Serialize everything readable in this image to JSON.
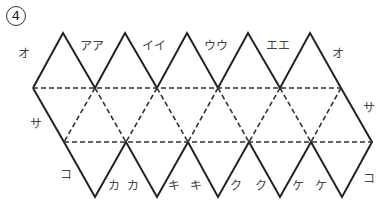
{
  "problem_number": "4",
  "labels": {
    "top": [
      {
        "text": "オ",
        "x": 18,
        "y": 48
      },
      {
        "text": "アア",
        "x": 80,
        "y": 40
      },
      {
        "text": "イイ",
        "x": 142,
        "y": 40
      },
      {
        "text": "ウウ",
        "x": 204,
        "y": 40
      },
      {
        "text": "エエ",
        "x": 266,
        "y": 40
      },
      {
        "text": "オ",
        "x": 332,
        "y": 48
      }
    ],
    "side": [
      {
        "text": "サ",
        "x": 30,
        "y": 118
      },
      {
        "text": "サ",
        "x": 363,
        "y": 102
      }
    ],
    "bottom": [
      {
        "text": "コ",
        "x": 60,
        "y": 169
      },
      {
        "text": "カ",
        "x": 108,
        "y": 180
      },
      {
        "text": "カ",
        "x": 127,
        "y": 180
      },
      {
        "text": "キ",
        "x": 168,
        "y": 180
      },
      {
        "text": "キ",
        "x": 190,
        "y": 180
      },
      {
        "text": "ク",
        "x": 230,
        "y": 180
      },
      {
        "text": "ク",
        "x": 255,
        "y": 180
      },
      {
        "text": "ケ",
        "x": 292,
        "y": 180
      },
      {
        "text": "ケ",
        "x": 315,
        "y": 180
      },
      {
        "text": "コ",
        "x": 363,
        "y": 173
      }
    ]
  },
  "colors": {
    "line": "#222222",
    "text": "#444444"
  }
}
